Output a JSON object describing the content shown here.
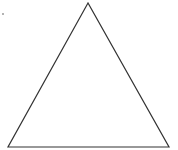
{
  "diagram": {
    "shape": "triangle",
    "type": "equilateral-outline",
    "stroke_color": "#333333",
    "fill_color": "#ffffff",
    "stroke_width": 1.2,
    "vertices": {
      "apex": [
        88,
        3
      ],
      "bottom_left": [
        8,
        147
      ],
      "bottom_right": [
        169,
        147
      ]
    }
  },
  "background_color": "#ffffff"
}
